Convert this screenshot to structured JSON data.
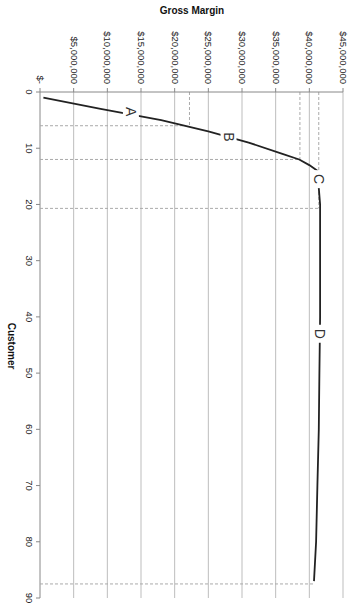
{
  "chart_data": {
    "type": "line",
    "title": "",
    "ylabel": "Gross Margin",
    "xlabel": "Customer",
    "orientation": "rotated-90-clockwise",
    "x_axis": {
      "min": 0,
      "max": 90,
      "ticks": [
        0,
        10,
        20,
        30,
        40,
        50,
        60,
        70,
        80,
        90
      ]
    },
    "y_axis": {
      "min": 0,
      "max": 45000000,
      "tick_labels": [
        "$-",
        "$5,000,000",
        "$10,000,000",
        "$15,000,000",
        "$20,000,000",
        "$25,000,000",
        "$30,000,000",
        "$35,000,000",
        "$40,000,000",
        "$45,000,000"
      ]
    },
    "grid": true,
    "series": [
      {
        "name": "Cumulative Gross Margin",
        "x": [
          1,
          3,
          5,
          7,
          9,
          11,
          12,
          13,
          14,
          20,
          30,
          40,
          50,
          60,
          70,
          80,
          87
        ],
        "values": [
          500000,
          9000000,
          18000000,
          25000000,
          31000000,
          36000000,
          38500000,
          40000000,
          41200000,
          41600000,
          41600000,
          41600000,
          41500000,
          41400000,
          41200000,
          41000000,
          40700000
        ]
      }
    ],
    "segment_labels": [
      {
        "label": "A",
        "x": 3.5,
        "y": 13500000
      },
      {
        "label": "B",
        "x": 8,
        "y": 28000000
      },
      {
        "label": "C",
        "x": 15.5,
        "y": 41500000
      },
      {
        "label": "D",
        "x": 43,
        "y": 41600000
      }
    ],
    "reference_lines": {
      "horizontal_customer": [
        6,
        12,
        20.7,
        87.5
      ],
      "vertical_margin": [
        22200000,
        38600000,
        41400000
      ]
    }
  }
}
